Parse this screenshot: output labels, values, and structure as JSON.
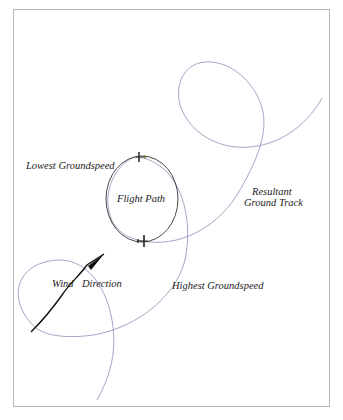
{
  "labels": {
    "lowest_groundspeed": "Lowest Groundspeed",
    "flight_path": "Flight Path",
    "resultant": "Resultant",
    "ground_track": "Ground Track",
    "wind": "Wind",
    "direction": "Direction",
    "highest_groundspeed": "Highest Groundspeed"
  },
  "colors": {
    "flight_path": "#333333",
    "ground_track": "#8a8fb8",
    "wind_arrow": "#111111",
    "frame": "#b8b8b8"
  }
}
